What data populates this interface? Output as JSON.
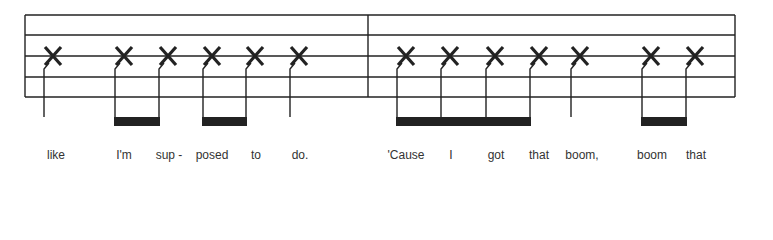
{
  "notation": {
    "type": "rhythm-staff",
    "colors": {
      "ink": "#222222",
      "lyric": "#333333",
      "background": "#ffffff"
    },
    "staff": {
      "left": 25,
      "right": 735,
      "line_ys": [
        15,
        35,
        56,
        77,
        97
      ],
      "barlines": [
        368
      ]
    },
    "notehead_glyph": "X",
    "measures": [
      {
        "index": 1,
        "notes": [
          {
            "x": 44,
            "duration": "quarter",
            "lyric": "like"
          },
          {
            "x": 115,
            "duration": "eighth",
            "beam": 1,
            "lyric": "I'm"
          },
          {
            "x": 159,
            "duration": "eighth",
            "beam": 1,
            "lyric": "sup -"
          },
          {
            "x": 203,
            "duration": "eighth",
            "beam": 2,
            "lyric": "posed"
          },
          {
            "x": 246,
            "duration": "eighth",
            "beam": 2,
            "lyric": "to"
          },
          {
            "x": 290,
            "duration": "quarter",
            "lyric": "do."
          }
        ]
      },
      {
        "index": 2,
        "notes": [
          {
            "x": 397,
            "duration": "eighth",
            "beam": 3,
            "lyric": "'Cause"
          },
          {
            "x": 441,
            "duration": "eighth",
            "beam": 3,
            "lyric": "I"
          },
          {
            "x": 486,
            "duration": "eighth",
            "beam": 3,
            "lyric": "got"
          },
          {
            "x": 530,
            "duration": "eighth",
            "beam": 3,
            "lyric": "that"
          },
          {
            "x": 571,
            "duration": "quarter",
            "lyric": "boom,"
          },
          {
            "x": 642,
            "duration": "eighth",
            "beam": 4,
            "lyric": "boom"
          },
          {
            "x": 686,
            "duration": "eighth",
            "beam": 4,
            "lyric": "that"
          }
        ]
      }
    ],
    "beams": [
      {
        "id": 1,
        "x1": 115,
        "x2": 159
      },
      {
        "id": 2,
        "x1": 203,
        "x2": 246
      },
      {
        "id": 3,
        "x1": 397,
        "x2": 530
      },
      {
        "id": 4,
        "x1": 642,
        "x2": 686
      }
    ]
  },
  "lyrics": [
    {
      "x": 56,
      "text": "like"
    },
    {
      "x": 124,
      "text": "I'm"
    },
    {
      "x": 169,
      "text": "sup -"
    },
    {
      "x": 212,
      "text": "posed"
    },
    {
      "x": 256,
      "text": "to"
    },
    {
      "x": 300,
      "text": "do."
    },
    {
      "x": 406,
      "text": "'Cause"
    },
    {
      "x": 451,
      "text": "I"
    },
    {
      "x": 496,
      "text": "got"
    },
    {
      "x": 539,
      "text": "that"
    },
    {
      "x": 582,
      "text": "boom,"
    },
    {
      "x": 652,
      "text": "boom"
    },
    {
      "x": 696,
      "text": "that"
    }
  ]
}
